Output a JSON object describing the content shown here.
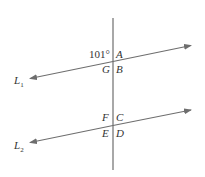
{
  "diagram": {
    "type": "parallel-lines-transversal",
    "colors": {
      "line": "#6e6e6e",
      "text": "#333333",
      "background": "#ffffff"
    },
    "angle_given": {
      "value": "101°",
      "position": "above L1, left of transversal"
    },
    "lines": {
      "L1": {
        "name": "L",
        "subscript": "1"
      },
      "L2": {
        "name": "L",
        "subscript": "2"
      },
      "transversal": {
        "orientation": "vertical"
      }
    },
    "angles": {
      "A": "A",
      "B": "B",
      "G": "G",
      "C": "C",
      "D": "D",
      "E": "E",
      "F": "F"
    }
  }
}
